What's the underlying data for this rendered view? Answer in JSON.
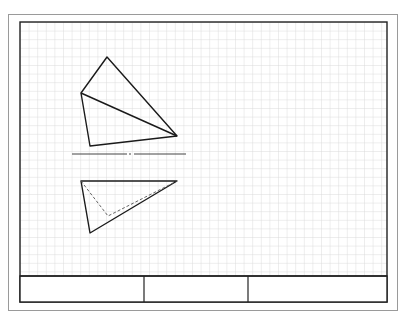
{
  "sheet": {
    "outer_frame": {
      "x": 8,
      "y": 14,
      "w": 390,
      "h": 297,
      "color": "#9a9a9a"
    },
    "inner_frame": {
      "x": 20,
      "y": 22,
      "w": 367,
      "h": 280,
      "color": "#222222"
    },
    "grid": {
      "spacing": 8.6,
      "color": "#d4d4d4"
    }
  },
  "title_block": {
    "top_y": 276,
    "dividers_x": [
      144,
      248
    ],
    "cells": [
      "",
      "",
      ""
    ]
  },
  "views": {
    "top_view": {
      "outline": [
        [
          107,
          57
        ],
        [
          177,
          136
        ],
        [
          90,
          146
        ],
        [
          81,
          93
        ]
      ],
      "edges": [
        [
          [
            107,
            57
          ],
          [
            81,
            93
          ]
        ],
        [
          [
            81,
            93
          ],
          [
            177,
            136
          ]
        ]
      ]
    },
    "reference_line": {
      "y": 154,
      "x1": 72,
      "x2": 186,
      "gap": [
        127,
        134
      ]
    },
    "front_view": {
      "outline": [
        [
          81,
          181
        ],
        [
          177,
          181
        ],
        [
          90,
          233
        ]
      ],
      "hidden_edges": [
        [
          [
            81,
            181
          ],
          [
            108,
            216
          ]
        ],
        [
          [
            108,
            216
          ],
          [
            177,
            181
          ]
        ]
      ]
    }
  }
}
